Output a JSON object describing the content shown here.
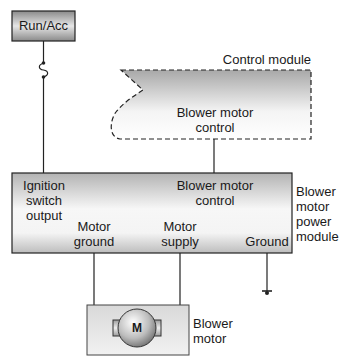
{
  "diagram": {
    "power_source": {
      "label": "Run/Acc"
    },
    "fuse": {
      "icon": "fuse-icon"
    },
    "control_module": {
      "title": "Control module",
      "output_label_line1": "Blower motor",
      "output_label_line2": "control"
    },
    "power_module": {
      "name_line1": "Blower",
      "name_line2": "motor",
      "name_line3": "power",
      "name_line4": "module",
      "terminals": {
        "ignition_line1": "Ignition",
        "ignition_line2": "switch",
        "ignition_line3": "output",
        "control_line1": "Blower motor",
        "control_line2": "control",
        "motor_ground_line1": "Motor",
        "motor_ground_line2": "ground",
        "motor_supply_line1": "Motor",
        "motor_supply_line2": "supply",
        "ground": "Ground"
      }
    },
    "blower_motor": {
      "symbol": "M",
      "name_line1": "Blower",
      "name_line2": "motor"
    },
    "ground_symbol": {
      "icon": "ground-icon"
    }
  }
}
